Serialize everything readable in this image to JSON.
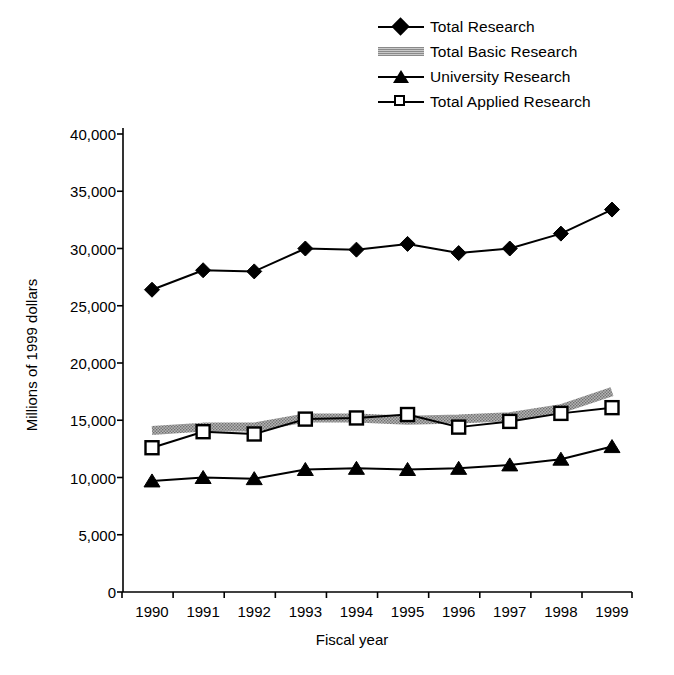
{
  "chart_data": {
    "type": "line",
    "title": "",
    "subtitle": "",
    "xlabel": "Fiscal year",
    "ylabel": "Millions of 1999 dollars",
    "x": [
      1990,
      1991,
      1992,
      1993,
      1994,
      1995,
      1996,
      1997,
      1998,
      1999
    ],
    "categories": [
      "1990",
      "1991",
      "1992",
      "1993",
      "1994",
      "1995",
      "1996",
      "1997",
      "1998",
      "1999"
    ],
    "xlim": [
      1989.5,
      1999.5
    ],
    "ylim": [
      0,
      40000
    ],
    "ytick_values": [
      0,
      5000,
      10000,
      15000,
      20000,
      25000,
      30000,
      35000,
      40000
    ],
    "ytick_labels": [
      "0",
      "5,000",
      "10,000",
      "15,000",
      "20,000",
      "25,000",
      "30,000",
      "35,000",
      "40,000"
    ],
    "grid": false,
    "legend_position": "top-right",
    "series": [
      {
        "name": "Total Research",
        "marker": "filled-diamond",
        "style": "line-marker",
        "color": "#000000",
        "values": [
          26400,
          28100,
          28000,
          30000,
          29900,
          30400,
          29600,
          30000,
          31300,
          33400
        ]
      },
      {
        "name": "Total Basic Research",
        "marker": "none",
        "style": "thick-gray-band",
        "color": "#9a9a9a",
        "values": [
          14100,
          14400,
          14400,
          15200,
          15200,
          15000,
          15100,
          15300,
          16000,
          17500
        ]
      },
      {
        "name": "University Research",
        "marker": "filled-triangle",
        "style": "line-marker",
        "color": "#000000",
        "values": [
          9700,
          10000,
          9900,
          10700,
          10800,
          10700,
          10800,
          11100,
          11600,
          12700
        ]
      },
      {
        "name": "Total Applied Research",
        "marker": "open-square",
        "style": "line-marker",
        "color": "#000000",
        "values": [
          12600,
          14000,
          13800,
          15100,
          15200,
          15500,
          14400,
          14900,
          15600,
          16100
        ]
      }
    ]
  },
  "legend": {
    "items": [
      {
        "label": "Total Research",
        "key": "diamond-line-icon"
      },
      {
        "label": "Total Basic Research",
        "key": "gray-band-icon"
      },
      {
        "label": "University Research",
        "key": "triangle-line-icon"
      },
      {
        "label": "Total Applied Research",
        "key": "open-square-line-icon"
      }
    ]
  },
  "axes": {
    "x_title": "Fiscal year",
    "y_title": "Millions of 1999 dollars"
  }
}
